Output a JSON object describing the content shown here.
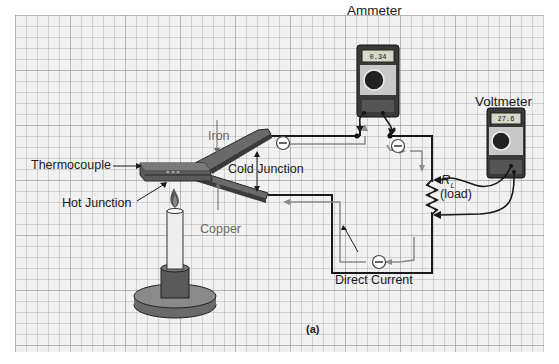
{
  "figure": {
    "panel_label": "(a)",
    "labels": {
      "ammeter": "Ammeter",
      "voltmeter": "Voltmeter",
      "thermocouple": "Thermocouple",
      "hot_junction": "Hot Junction",
      "cold_junction": "Cold Junction",
      "iron": "Iron",
      "copper": "Copper",
      "resistor_symbol": "R",
      "resistor_subscript": "L",
      "resistor_note": "(load)",
      "direct_current": "Direct Current"
    },
    "ammeter_reading": "0.34",
    "voltmeter_reading": "27.6",
    "electron_symbol": "−",
    "colors": {
      "grid_bg": "#f1f1f1",
      "wire": "#1a1a1a",
      "current_arrow": "#8a8a8a",
      "metal": "#5a5a5a",
      "meter_body": "#3a3a3a"
    }
  }
}
